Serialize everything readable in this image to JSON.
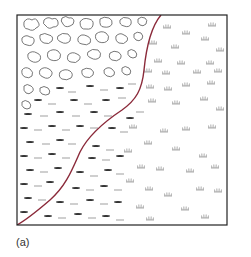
{
  "figure": {
    "panel_label": "(a)",
    "frame": {
      "x": 17,
      "y": 15,
      "width": 210,
      "height": 210,
      "stroke": "#222222"
    },
    "boundary_curve": {
      "color": "#8b2a3a",
      "points": [
        [
          161,
          15
        ],
        [
          152,
          26
        ],
        [
          147,
          42
        ],
        [
          145,
          60
        ],
        [
          143,
          78
        ],
        [
          139,
          94
        ],
        [
          130,
          104
        ],
        [
          116,
          114
        ],
        [
          100,
          126
        ],
        [
          86,
          140
        ],
        [
          78,
          156
        ],
        [
          72,
          172
        ],
        [
          62,
          188
        ],
        [
          46,
          204
        ],
        [
          30,
          216
        ],
        [
          17,
          225
        ]
      ]
    },
    "regions": [
      {
        "name": "rock-debris",
        "symbol": "cloud-outline",
        "color": "#555555"
      },
      {
        "name": "marsh",
        "symbol": "dash",
        "color": "#333333"
      },
      {
        "name": "grassland",
        "symbol": "grass-tuft",
        "color": "#888888"
      }
    ]
  }
}
